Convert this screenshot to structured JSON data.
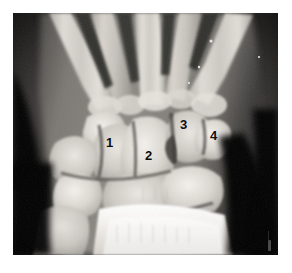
{
  "figure": {
    "kind": "radiograph",
    "modality": "X-ray",
    "body_part": "wrist",
    "view": "posteroanterior",
    "alt": "Grayscale plain radiograph of a wrist showing metacarpals, carpal bones, radius and ulna, with four numbered annotations.",
    "plate": {
      "left": 13,
      "top": 13,
      "width": 265,
      "height": 242,
      "background_color": "#0a0a0a"
    },
    "page_background_color": "#ffffff"
  },
  "annotations": {
    "label_color": "#0d0d0d",
    "items": [
      {
        "id": "annotation-1",
        "text": "1",
        "x": 106,
        "y": 136,
        "target": "scaphoid"
      },
      {
        "id": "annotation-2",
        "text": "2",
        "x": 145,
        "y": 149,
        "target": "capitate"
      },
      {
        "id": "annotation-3",
        "text": "3",
        "x": 180,
        "y": 118,
        "target": "hamate"
      },
      {
        "id": "annotation-4",
        "text": "4",
        "x": 210,
        "y": 129,
        "target": "triquetrum"
      }
    ]
  },
  "marker": {
    "name": "film-side-marker",
    "x": 268,
    "y": 240,
    "color": "#585858"
  },
  "palette": {
    "bone_bright": "#f2f0ec",
    "bone_mid": "#cfccc6",
    "soft_tissue": "#8e8b86",
    "background_dark": "#070707",
    "film_edge": "#1a1a1a"
  }
}
